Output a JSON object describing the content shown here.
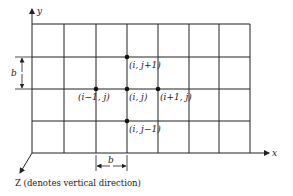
{
  "diagram": {
    "axes": {
      "x_label": "x",
      "y_label": "y",
      "z_label": "Z (denotes vertical direction)"
    },
    "grid": {
      "columns_x": [
        32,
        64,
        96,
        127,
        158,
        189,
        219,
        250
      ],
      "rows_y": [
        24,
        57,
        89,
        121,
        153
      ]
    },
    "nodes": [
      {
        "id": "i_jp1",
        "label": "(i, j+1)",
        "x": 127,
        "y": 57
      },
      {
        "id": "im1_j",
        "label": "(i−1, j)",
        "x": 96,
        "y": 89
      },
      {
        "id": "i_j",
        "label": "(i, j)",
        "x": 127,
        "y": 89
      },
      {
        "id": "ip1_j",
        "label": "(i+1, j)",
        "x": 158,
        "y": 89
      },
      {
        "id": "i_jm1",
        "label": "(i, j−1)",
        "x": 127,
        "y": 121
      }
    ],
    "dimensions": {
      "vertical_spacing_label": "b",
      "horizontal_spacing_label": "b"
    },
    "colors": {
      "line": "#222222",
      "background": "#ffffff"
    }
  }
}
